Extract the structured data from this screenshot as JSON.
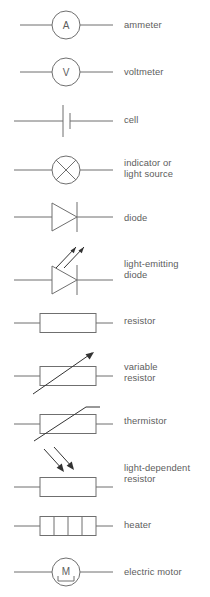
{
  "figure": {
    "kind": "circuit-symbol-key",
    "stroke_color": "#6f6f6f",
    "text_color": "#5d5d5d",
    "background": "#ffffff"
  },
  "rows": [
    {
      "id": "ammeter",
      "symbol": "ammeter-symbol",
      "glyph": "A",
      "label": "ammeter",
      "top": 4,
      "label_top": 19
    },
    {
      "id": "voltmeter",
      "symbol": "voltmeter-symbol",
      "glyph": "V",
      "label": "voltmeter",
      "top": 51,
      "label_top": 66
    },
    {
      "id": "cell",
      "symbol": "cell-symbol",
      "glyph": "",
      "label": "cell",
      "top": 99,
      "label_top": 114
    },
    {
      "id": "indicator",
      "symbol": "lamp-symbol",
      "glyph": "",
      "label": "indicator or\nlight source",
      "top": 148,
      "label_top": 157
    },
    {
      "id": "diode",
      "symbol": "diode-symbol",
      "glyph": "",
      "label": "diode",
      "top": 197,
      "label_top": 212
    },
    {
      "id": "light-emitting-diode",
      "symbol": "led-symbol",
      "glyph": "",
      "label": "light-emitting\ndiode",
      "top": 240,
      "label_top": 258
    },
    {
      "id": "resistor",
      "symbol": "resistor-symbol",
      "glyph": "",
      "label": "resistor",
      "top": 305,
      "label_top": 315
    },
    {
      "id": "variable-resistor",
      "symbol": "variable-resistor-symbol",
      "glyph": "",
      "label": "variable\nresistor",
      "top": 348,
      "label_top": 361
    },
    {
      "id": "thermistor",
      "symbol": "thermistor-symbol",
      "symbol_label": "thermistor",
      "glyph": "",
      "label": "thermistor",
      "top": 401,
      "label_top": 415
    },
    {
      "id": "light-dependent-resistor",
      "symbol": "ldr-symbol",
      "glyph": "",
      "label": "light-dependent\nresistor",
      "top": 443,
      "label_top": 462
    },
    {
      "id": "heater",
      "symbol": "heater-symbol",
      "glyph": "",
      "label": "heater",
      "top": 508,
      "label_top": 519
    },
    {
      "id": "electric-motor",
      "symbol": "motor-symbol",
      "glyph": "M",
      "label": "electric motor",
      "top": 551,
      "label_top": 566
    }
  ]
}
